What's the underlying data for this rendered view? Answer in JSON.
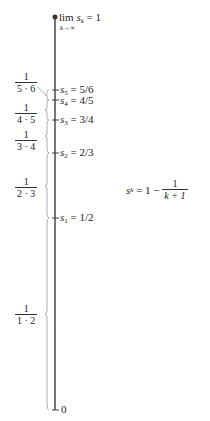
{
  "diagram": {
    "limit_label": {
      "prefix": "lim",
      "var": "s",
      "sub": "k",
      "eq": " = 1",
      "under": "k→∞"
    },
    "zero_label": "0",
    "points": [
      {
        "name": "s",
        "sub": "5",
        "value": " = 5/6",
        "y": 90
      },
      {
        "name": "s",
        "sub": "4",
        "value": " = 4/5",
        "y": 100
      },
      {
        "name": "s",
        "sub": "3",
        "value": " = 3/4",
        "y": 120
      },
      {
        "name": "s",
        "sub": "2",
        "value": " = 2/3",
        "y": 153
      },
      {
        "name": "s",
        "sub": "1",
        "value": " = 1/2",
        "y": 218
      }
    ],
    "increments": [
      {
        "num": "1",
        "den": "5 · 6"
      },
      {
        "num": "1",
        "den": "4 · 5"
      },
      {
        "num": "1",
        "den": "3 · 4"
      },
      {
        "num": "1",
        "den": "2 · 3"
      },
      {
        "num": "1",
        "den": "1 · 2"
      }
    ],
    "formula": {
      "lhs_var": "s",
      "lhs_sub": "k",
      "eq": " = 1 − ",
      "num": "1",
      "den": "k + 1"
    },
    "colors": {
      "axis": "#555555",
      "bracket": "#888888",
      "text": "#222222"
    }
  }
}
